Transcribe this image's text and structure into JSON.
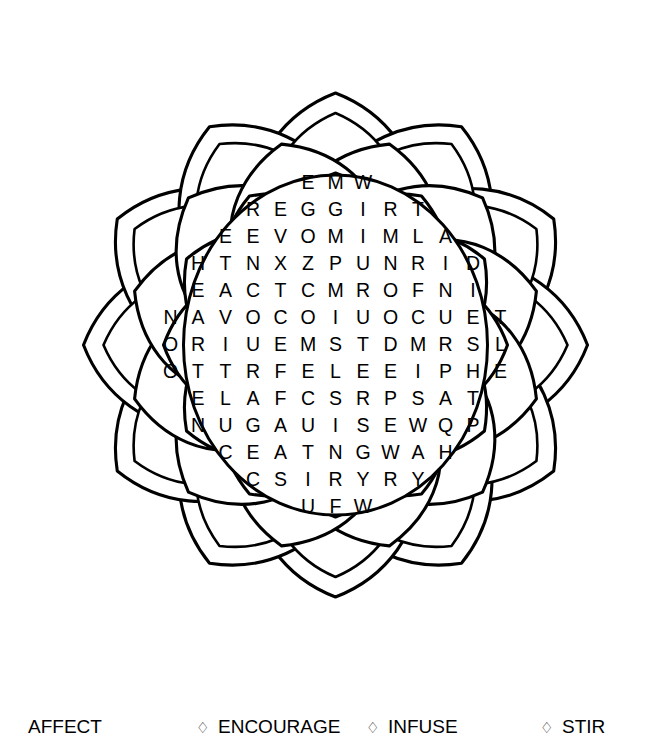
{
  "page": {
    "background_color": "#ffffff",
    "ink_color": "#000000"
  },
  "mandala": {
    "name": "flower-mandala",
    "ring_count": 3,
    "outer_petals": 12,
    "middle_petals": 12,
    "inner_petals": 12,
    "center_shape": "circle",
    "stroke_color": "#000000",
    "fill_color": "#ffffff"
  },
  "grid": {
    "rows": [
      [
        "E",
        "M",
        "W"
      ],
      [
        "R",
        "E",
        "G",
        "G",
        "I",
        "R",
        "T"
      ],
      [
        "E",
        "E",
        "V",
        "O",
        "M",
        "I",
        "M",
        "L",
        "A"
      ],
      [
        "H",
        "T",
        "N",
        "X",
        "Z",
        "P",
        "U",
        "N",
        "R",
        "I",
        "D"
      ],
      [
        "E",
        "A",
        "C",
        "T",
        "C",
        "M",
        "R",
        "O",
        "F",
        "N",
        "I"
      ],
      [
        "N",
        "A",
        "V",
        "O",
        "C",
        "O",
        "I",
        "U",
        "O",
        "C",
        "U",
        "E",
        "T"
      ],
      [
        "O",
        "R",
        "I",
        "U",
        "E",
        "M",
        "S",
        "T",
        "D",
        "M",
        "R",
        "S",
        "L"
      ],
      [
        "O",
        "T",
        "T",
        "R",
        "F",
        "E",
        "L",
        "E",
        "E",
        "I",
        "P",
        "H",
        "E"
      ],
      [
        "E",
        "L",
        "A",
        "F",
        "C",
        "S",
        "R",
        "P",
        "S",
        "A",
        "T"
      ],
      [
        "N",
        "U",
        "G",
        "A",
        "U",
        "I",
        "S",
        "E",
        "W",
        "Q",
        "P"
      ],
      [
        "C",
        "E",
        "A",
        "T",
        "N",
        "G",
        "W",
        "A",
        "H"
      ],
      [
        "C",
        "S",
        "I",
        "R",
        "Y",
        "R",
        "Y"
      ],
      [
        "U",
        "F",
        "W"
      ]
    ],
    "row_count": 13,
    "max_row_length": 13
  },
  "word_list": {
    "bullet_glyph": "♢",
    "words": [
      {
        "label": "AFFECT",
        "bullet": ""
      },
      {
        "label": "ENCOURAGE",
        "bullet": "♢"
      },
      {
        "label": "INFUSE",
        "bullet": "♢"
      },
      {
        "label": "STIR",
        "bullet": "♢"
      }
    ]
  }
}
